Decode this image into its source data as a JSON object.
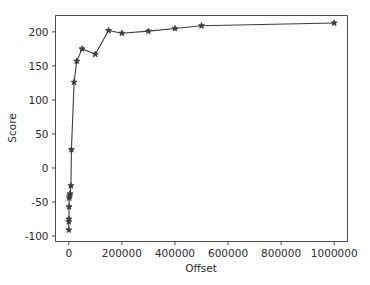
{
  "chart_data": {
    "type": "line",
    "title": "",
    "xlabel": "Offset",
    "ylabel": "Score",
    "xlim": [
      -50000,
      1050000
    ],
    "ylim": [
      -108,
      224
    ],
    "grid": false,
    "legend": null,
    "marker": "star",
    "line_color": "#3d3d3d",
    "xticks": [
      0,
      200000,
      400000,
      600000,
      800000,
      1000000
    ],
    "xtick_labels": [
      "0",
      "200000",
      "400000",
      "600000",
      "800000",
      "1000000"
    ],
    "yticks": [
      -100,
      -50,
      0,
      50,
      100,
      150,
      200
    ],
    "ytick_labels": [
      "-100",
      "-50",
      "0",
      "50",
      "100",
      "150",
      "200"
    ],
    "x": [
      0,
      200,
      500,
      1000,
      2000,
      3000,
      5000,
      8000,
      10000,
      20000,
      30000,
      50000,
      100000,
      150000,
      200000,
      300000,
      400000,
      500000,
      1000000
    ],
    "y": [
      -91,
      -79,
      -75,
      -57,
      -44,
      -41,
      -38,
      -26,
      27,
      126,
      157,
      175,
      167,
      202,
      198,
      201,
      205,
      209,
      213
    ],
    "series": [
      {
        "name": "Score vs Offset",
        "values": [
          -91,
          -79,
          -75,
          -57,
          -44,
          -41,
          -38,
          -26,
          27,
          126,
          157,
          175,
          167,
          202,
          198,
          201,
          205,
          209,
          213
        ]
      }
    ]
  },
  "figure": {
    "background_color": "#ffffff",
    "axes_color": "#4c4c4c",
    "text_color": "#2b2b2b"
  }
}
